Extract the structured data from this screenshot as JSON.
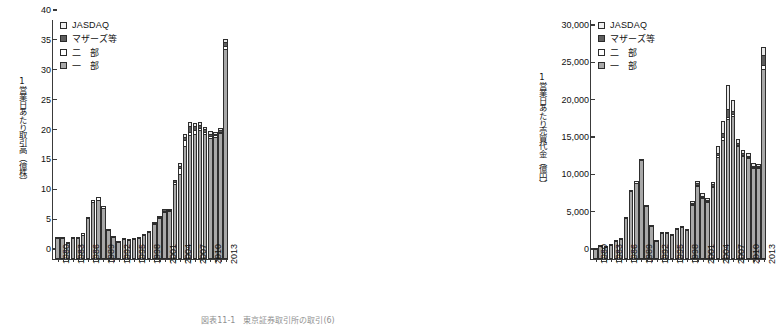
{
  "figure": {
    "caption": "図表11-1　東京証券取引所の取引(6)"
  },
  "legend": {
    "items": [
      {
        "key": "jasdaq",
        "label": "JASDAQ",
        "color": "#f0f0f0"
      },
      {
        "key": "mothers",
        "label": "マザーズ等",
        "color": "#5e5e5e"
      },
      {
        "key": "nibu",
        "label": "二　部",
        "color": "#ffffff"
      },
      {
        "key": "ichibu",
        "label": "一　部",
        "color": "#a8a8a8"
      }
    ]
  },
  "chart_data": [
    {
      "id": "volume",
      "type": "bar",
      "stacked": true,
      "title": "",
      "ylabel": "1営業日あたり取引高（億株）",
      "xlabel": "",
      "ylim": [
        0,
        40
      ],
      "yticks": [
        0,
        5,
        10,
        15,
        20,
        25,
        30,
        35,
        40
      ],
      "ytick_labels": [
        "0",
        "5",
        "10",
        "15",
        "20",
        "25",
        "30",
        "35",
        "40"
      ],
      "grid": false,
      "legend_position": "top-left",
      "categories": [
        "1980",
        "1981",
        "1982",
        "1983",
        "1984",
        "1985",
        "1986",
        "1987",
        "1988",
        "1989",
        "1990",
        "1991",
        "1992",
        "1993",
        "1994",
        "1995",
        "1996",
        "1997",
        "1998",
        "1999",
        "2000",
        "2001",
        "2002",
        "2003",
        "2004",
        "2005",
        "2006",
        "2007",
        "2008",
        "2009",
        "2010",
        "2011",
        "2012",
        "2013"
      ],
      "xtick_labels": [
        "1980",
        "1983",
        "1986",
        "1989",
        "1992",
        "1995",
        "1998",
        "2001",
        "2004",
        "2007",
        "2010",
        "2013"
      ],
      "series": [
        {
          "name": "一　部",
          "key": "ichibu",
          "values": [
            3.5,
            3.6,
            2.7,
            3.6,
            3.6,
            4.0,
            6.8,
            9.5,
            9.9,
            8.5,
            4.8,
            3.7,
            2.8,
            3.4,
            3.2,
            3.3,
            3.6,
            4.1,
            4.5,
            5.8,
            6.8,
            7.9,
            8.0,
            12.6,
            14.3,
            18.9,
            20.7,
            21.0,
            21.6,
            20.9,
            20.3,
            20.4,
            21.1,
            35.2
          ]
        },
        {
          "name": "二　部",
          "key": "nibu",
          "values": [
            0.1,
            0.1,
            0.1,
            0.1,
            0.1,
            0.3,
            0.3,
            0.3,
            0.4,
            0.4,
            0.2,
            0.1,
            0.1,
            0.1,
            0.1,
            0.1,
            0.1,
            0.1,
            0.1,
            0.2,
            0.2,
            0.2,
            0.2,
            0.3,
            1.0,
            1.1,
            0.5,
            0.6,
            0.4,
            0.3,
            0.3,
            0.3,
            0.2,
            0.5
          ]
        },
        {
          "name": "マザーズ等",
          "key": "mothers",
          "values": [
            0,
            0,
            0,
            0,
            0,
            0,
            0,
            0,
            0,
            0,
            0,
            0,
            0,
            0,
            0,
            0,
            0,
            0,
            0,
            0.1,
            0.2,
            0.2,
            0.2,
            0.3,
            0.3,
            0.5,
            1.0,
            0.6,
            0.5,
            0.5,
            0.4,
            0.3,
            0.3,
            0.7
          ]
        },
        {
          "name": "JASDAQ",
          "key": "jasdaq",
          "values": [
            0,
            0,
            0,
            0,
            0,
            0,
            0,
            0,
            0,
            0,
            0,
            0,
            0,
            0,
            0,
            0,
            0,
            0,
            0,
            0,
            0,
            0,
            0,
            0,
            0.4,
            0.5,
            0.8,
            0.6,
            0.4,
            0.4,
            0.4,
            0.3,
            0.3,
            0.4
          ]
        }
      ]
    },
    {
      "id": "turnover",
      "type": "bar",
      "stacked": true,
      "title": "",
      "ylabel": "1営業日あたり売買代金（億円）",
      "xlabel": "",
      "ylim": [
        0,
        32000
      ],
      "yticks": [
        0,
        5000,
        10000,
        15000,
        20000,
        25000,
        30000
      ],
      "ytick_labels": [
        "0",
        "5,000",
        "10,000",
        "15,000",
        "20,000",
        "25,000",
        "30,000"
      ],
      "grid": false,
      "legend_position": "top-left",
      "categories": [
        "1980",
        "1981",
        "1982",
        "1983",
        "1984",
        "1985",
        "1986",
        "1987",
        "1988",
        "1989",
        "1990",
        "1991",
        "1992",
        "1993",
        "1994",
        "1995",
        "1996",
        "1997",
        "1998",
        "1999",
        "2000",
        "2001",
        "2002",
        "2003",
        "2004",
        "2005",
        "2006",
        "2007",
        "2008",
        "2009",
        "2010",
        "2011",
        "2012",
        "2013"
      ],
      "xtick_labels": [
        "1980",
        "1983",
        "1986",
        "1989",
        "1992",
        "1995",
        "1998",
        "2001",
        "2004",
        "2007",
        "2010",
        "2013"
      ],
      "series": [
        {
          "name": "一　部",
          "key": "ichibu",
          "values": [
            1350,
            1750,
            1550,
            1900,
            2400,
            2650,
            5550,
            9100,
            10200,
            13200,
            7150,
            4400,
            2350,
            3450,
            3450,
            3250,
            4000,
            4350,
            3900,
            7200,
            9800,
            8200,
            7650,
            9650,
            13650,
            15900,
            18800,
            19100,
            15100,
            13800,
            13500,
            12200,
            12150,
            25500
          ]
        },
        {
          "name": "二　部",
          "key": "nibu",
          "values": [
            50,
            60,
            50,
            60,
            80,
            120,
            130,
            200,
            200,
            250,
            120,
            80,
            60,
            80,
            80,
            80,
            90,
            90,
            80,
            150,
            160,
            140,
            130,
            170,
            250,
            400,
            250,
            300,
            150,
            120,
            120,
            110,
            100,
            450
          ]
        },
        {
          "name": "マザーズ等",
          "key": "mothers",
          "values": [
            0,
            0,
            0,
            0,
            0,
            0,
            0,
            0,
            0,
            0,
            0,
            0,
            0,
            0,
            0,
            0,
            0,
            0,
            0,
            150,
            200,
            160,
            140,
            200,
            250,
            550,
            1100,
            450,
            280,
            250,
            200,
            180,
            160,
            1400
          ]
        },
        {
          "name": "JASDAQ",
          "key": "jasdaq",
          "values": [
            0,
            0,
            0,
            0,
            0,
            0,
            0,
            0,
            0,
            0,
            0,
            0,
            0,
            0,
            0,
            0,
            0,
            0,
            0,
            300,
            350,
            280,
            250,
            350,
            1050,
            1650,
            3100,
            1400,
            500,
            450,
            400,
            330,
            300,
            1100
          ]
        }
      ]
    }
  ]
}
